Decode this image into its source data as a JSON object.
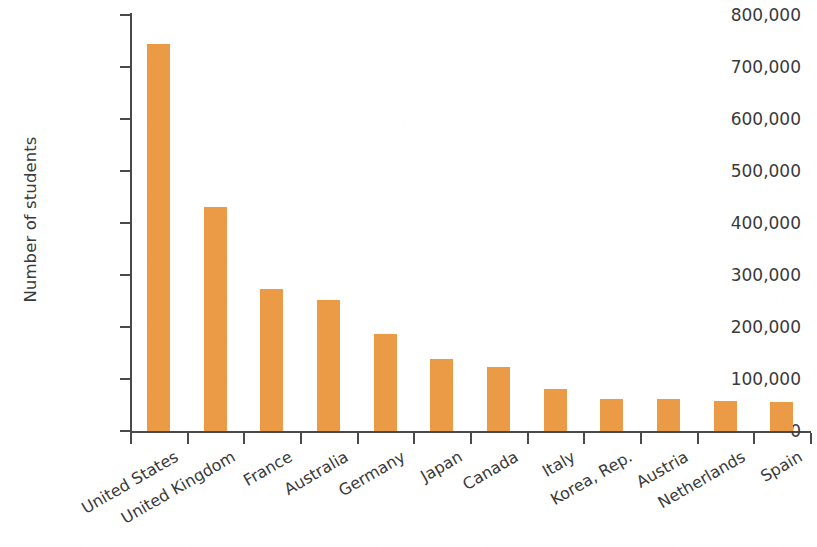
{
  "chart_data": {
    "type": "bar",
    "title": "",
    "xlabel": "",
    "ylabel": "Number of students",
    "categories": [
      "United States",
      "United Kingdom",
      "France",
      "Australia",
      "Germany",
      "Japan",
      "Canada",
      "Italy",
      "Korea, Rep.",
      "Austria",
      "Netherlands",
      "Spain"
    ],
    "values": [
      745000,
      430000,
      273000,
      252000,
      187000,
      138000,
      123000,
      80000,
      61000,
      61000,
      58000,
      56000
    ],
    "ylim": [
      0,
      800000
    ],
    "ytick_values": [
      0,
      100000,
      200000,
      300000,
      400000,
      500000,
      600000,
      700000,
      800000
    ],
    "ytick_labels": [
      "0",
      "100,000",
      "200,000",
      "300,000",
      "400,000",
      "500,000",
      "600,000",
      "700,000",
      "800,000"
    ],
    "grid": false,
    "legend": null,
    "legend_position": "none",
    "bar_color": "#eb9a45",
    "axis_color": "#4a4a4a",
    "text_color": "#3a3a3a",
    "background_color": "#ffffff",
    "xtick_label_rotation": -30
  }
}
